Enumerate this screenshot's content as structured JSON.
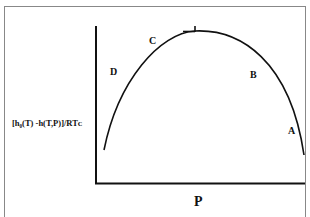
{
  "diagram": {
    "y_axis_label": "[h₀(T) -h(T,P)]/RTᴄ",
    "x_axis_label": "P",
    "point_labels": {
      "A": "A",
      "B": "B",
      "C": "C",
      "D": "D"
    },
    "curve": "inverted-parabola-like arc from low left rising to maximum near top then descending to right edge",
    "max_marker": "tick mark at peak"
  }
}
